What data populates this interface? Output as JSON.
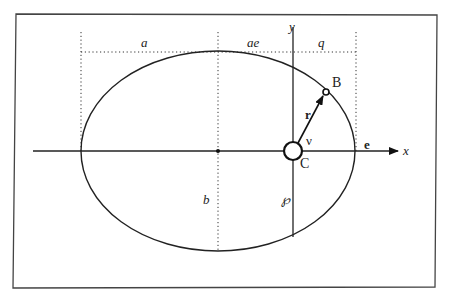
{
  "diagram": {
    "labels": {
      "a": "a",
      "ae": "ae",
      "q": "q",
      "y": "y",
      "x": "x",
      "B": "B",
      "C": "C",
      "r": "r",
      "nu": "ν",
      "e": "e",
      "b": "b",
      "p": "℘"
    },
    "colors": {
      "stroke": "#222222",
      "frame": "#444444",
      "background": "#ffffff"
    },
    "geometry": {
      "ellipse_center": [
        218,
        151
      ],
      "semi_major_px": 137,
      "semi_minor_px": 100,
      "focus_C": [
        293,
        151
      ],
      "point_B": [
        326,
        92
      ]
    }
  }
}
